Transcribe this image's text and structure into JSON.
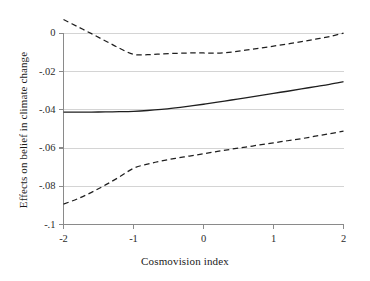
{
  "chart_data": {
    "type": "line",
    "title": "",
    "subtitle": "",
    "xlabel": "Cosmovision index",
    "ylabel": "Effects on belief in climate change",
    "xlim": [
      -2,
      2
    ],
    "ylim": [
      -0.1,
      0.008
    ],
    "xticks": [
      -2,
      -1,
      0,
      1,
      2
    ],
    "xticklabels": [
      "-2",
      "-1",
      "0",
      "1",
      "2"
    ],
    "yticks": [
      0,
      -0.02,
      -0.04,
      -0.06,
      -0.08,
      -0.1
    ],
    "yticklabels": [
      "0",
      "-.02",
      "-.04",
      "-.06",
      "-.08",
      "-.1"
    ],
    "grid": "horizontal",
    "legend": "none",
    "x": [
      -2,
      -1.8,
      -1.6,
      -1.4,
      -1.2,
      -1,
      -0.8,
      -0.6,
      -0.4,
      -0.2,
      0,
      0.2,
      0.4,
      0.6,
      0.8,
      1,
      1.2,
      1.4,
      1.6,
      1.8,
      2
    ],
    "series": [
      {
        "name": "Marginal effect",
        "style": "solid",
        "color": "#1f1f1f",
        "values": [
          -0.0412,
          -0.0412,
          -0.0412,
          -0.0411,
          -0.041,
          -0.0408,
          -0.0404,
          -0.0398,
          -0.039,
          -0.0381,
          -0.0371,
          -0.036,
          -0.0349,
          -0.0338,
          -0.0326,
          -0.0314,
          -0.0303,
          -0.0291,
          -0.0279,
          -0.0267,
          -0.0253
        ]
      },
      {
        "name": "Upper 95% CI",
        "style": "dashed",
        "color": "#1f1f1f",
        "values": [
          0.0072,
          0.0035,
          -0.0002,
          -0.004,
          -0.0078,
          -0.011,
          -0.0112,
          -0.0108,
          -0.0105,
          -0.0103,
          -0.0103,
          -0.0104,
          -0.0098,
          -0.0088,
          -0.0078,
          -0.0067,
          -0.0056,
          -0.0044,
          -0.0031,
          -0.0017,
          0.0001
        ]
      },
      {
        "name": "Lower 95% CI",
        "style": "dashed",
        "color": "#1f1f1f",
        "values": [
          -0.0893,
          -0.0866,
          -0.0832,
          -0.0793,
          -0.0751,
          -0.0706,
          -0.0684,
          -0.0668,
          -0.0654,
          -0.0642,
          -0.063,
          -0.0618,
          -0.0606,
          -0.0595,
          -0.0584,
          -0.0573,
          -0.0562,
          -0.0551,
          -0.0538,
          -0.0525,
          -0.0512
        ]
      }
    ],
    "colors": {
      "line": "#1f1f1f",
      "grid": "#d4d4d4",
      "axis": "#8a8a8a",
      "background": "#ffffff"
    }
  }
}
